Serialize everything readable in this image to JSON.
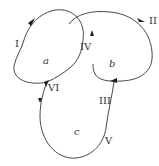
{
  "diagram": {
    "regions": [
      {
        "id": "a",
        "label": "a"
      },
      {
        "id": "b",
        "label": "b"
      },
      {
        "id": "c",
        "label": "c"
      }
    ],
    "curve_labels": {
      "I": "I",
      "II": "II",
      "III": "III",
      "IV": "IV",
      "V": "V",
      "VI": "VI"
    },
    "colors": {
      "stroke": "#333333",
      "background": "#ffffff"
    }
  }
}
